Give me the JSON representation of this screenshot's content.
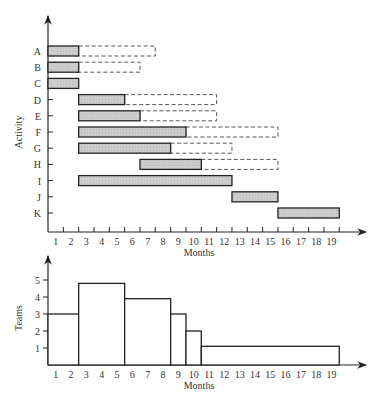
{
  "chart_data": [
    {
      "type": "gantt",
      "title": "",
      "xlabel": "Months",
      "ylabel": "Activity",
      "x_ticks": [
        "1",
        "2",
        "3",
        "4",
        "5",
        "6",
        "7",
        "8",
        "9",
        "10",
        "11",
        "12",
        "13",
        "14",
        "15",
        "16",
        "17",
        "18",
        "19"
      ],
      "activities": [
        {
          "name": "A",
          "start": 1,
          "end": 2,
          "slack_end": 7
        },
        {
          "name": "B",
          "start": 1,
          "end": 2,
          "slack_end": 6
        },
        {
          "name": "C",
          "start": 1,
          "end": 2,
          "slack_end": null
        },
        {
          "name": "D",
          "start": 3,
          "end": 5,
          "slack_end": 11
        },
        {
          "name": "E",
          "start": 3,
          "end": 6,
          "slack_end": 11
        },
        {
          "name": "F",
          "start": 3,
          "end": 9,
          "slack_end": 15
        },
        {
          "name": "G",
          "start": 3,
          "end": 8,
          "slack_end": 12
        },
        {
          "name": "H",
          "start": 7,
          "end": 10,
          "slack_end": 15
        },
        {
          "name": "I",
          "start": 3,
          "end": 12,
          "slack_end": null
        },
        {
          "name": "J",
          "start": 13,
          "end": 15,
          "slack_end": null
        },
        {
          "name": "K",
          "start": 16,
          "end": 19,
          "slack_end": null
        }
      ],
      "legend": {
        "solid_bar": "scheduled activity",
        "dashed_bar": "slack (float)"
      }
    },
    {
      "type": "step",
      "title": "",
      "xlabel": "Months",
      "ylabel": "Teams",
      "x_ticks": [
        "1",
        "2",
        "3",
        "4",
        "5",
        "6",
        "7",
        "8",
        "9",
        "10",
        "11",
        "12",
        "13",
        "14",
        "15",
        "16",
        "17",
        "18",
        "19"
      ],
      "y_ticks": [
        "1",
        "2",
        "3",
        "4",
        "5"
      ],
      "ylim": [
        0,
        5.5
      ],
      "segments": [
        {
          "start": 1,
          "end": 2,
          "teams": 3
        },
        {
          "start": 3,
          "end": 5,
          "teams": 5
        },
        {
          "start": 6,
          "end": 8,
          "teams": 4
        },
        {
          "start": 9,
          "end": 9,
          "teams": 3
        },
        {
          "start": 10,
          "end": 10,
          "teams": 2
        },
        {
          "start": 11,
          "end": 19,
          "teams": 1
        }
      ]
    }
  ],
  "colors": {
    "bar_fill": "#c8c8c8",
    "line": "#222222"
  }
}
